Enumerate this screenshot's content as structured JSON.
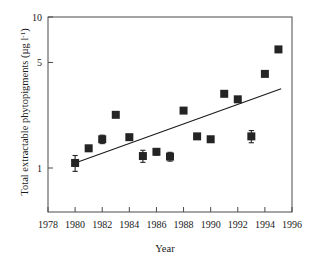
{
  "chart_data": {
    "type": "scatter",
    "title": "",
    "xlabel": "Year",
    "ylabel": "Total extractable phytopigments (µg l⁻¹)",
    "ylabel_main": "Total extractable phytopigments (µg l",
    "ylabel_sup": "-1",
    "ylabel_tail": ")",
    "yscale": "log",
    "xlim": [
      1978,
      1996
    ],
    "ylim": [
      0.55,
      10
    ],
    "grid": false,
    "legend": null,
    "xticks": [
      1978,
      1980,
      1982,
      1984,
      1986,
      1988,
      1990,
      1992,
      1994,
      1996
    ],
    "xticklabels": [
      "1978",
      "1980",
      "1982",
      "1984",
      "1986",
      "1988",
      "1990",
      "1992",
      "1994",
      "1996"
    ],
    "yticks": [
      1,
      5,
      10
    ],
    "yticklabels": [
      "1",
      "5",
      "10"
    ],
    "x": [
      1980,
      1981,
      1982,
      1983,
      1984,
      1985,
      1986,
      1987,
      1988,
      1989,
      1990,
      1991,
      1992,
      1993,
      1994,
      1995
    ],
    "values": [
      1.08,
      1.35,
      1.55,
      2.25,
      1.6,
      1.2,
      1.28,
      1.19,
      2.4,
      1.62,
      1.55,
      3.1,
      2.85,
      1.62,
      4.2,
      6.1
    ],
    "errors": [
      0.13,
      0.06,
      0.1,
      0.0,
      0.05,
      0.11,
      0.06,
      0.08,
      0.0,
      0.0,
      0.0,
      0.0,
      0.0,
      0.15,
      0.0,
      0.0
    ],
    "series": [
      {
        "name": "Total extractable phytopigments",
        "marker": "square",
        "color": "#242424",
        "x": [
          1980,
          1981,
          1982,
          1983,
          1984,
          1985,
          1986,
          1987,
          1988,
          1989,
          1990,
          1991,
          1992,
          1993,
          1994,
          1995
        ],
        "values": [
          1.08,
          1.35,
          1.55,
          2.25,
          1.6,
          1.2,
          1.28,
          1.19,
          2.4,
          1.62,
          1.55,
          3.1,
          2.85,
          1.62,
          4.2,
          6.1
        ],
        "errors": [
          0.13,
          0.06,
          0.1,
          0.0,
          0.05,
          0.11,
          0.06,
          0.08,
          0.0,
          0.0,
          0.0,
          0.0,
          0.0,
          0.15,
          0.0,
          0.0
        ]
      },
      {
        "name": "trend line",
        "type": "line",
        "color": "#1a1a1a",
        "x": [
          1980.0,
          1995.2
        ],
        "values": [
          1.08,
          3.35
        ]
      }
    ]
  },
  "colors": {
    "marker": "#242424",
    "trend": "#1a1a1a",
    "axis": "#4a4a4a",
    "text": "#1a1a1a",
    "background": "#ffffff"
  }
}
